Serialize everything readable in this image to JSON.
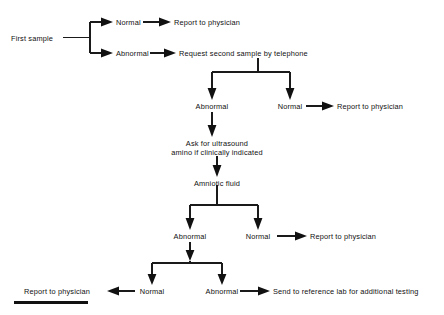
{
  "diagram": {
    "background": "#ffffff",
    "ink": "#111111",
    "nodes": {
      "first_sample": "First sample",
      "branch1_normal": "Normal",
      "branch1_normal_action": "Report to physician",
      "branch1_abnormal": "Abnormal",
      "branch1_abnormal_action": "Request second sample by telephone",
      "branch2_abnormal": "Abnormal",
      "branch2_normal": "Normal",
      "branch2_normal_action": "Report to physician",
      "ultrasound_line1": "Ask for ultrasound",
      "ultrasound_line2": "amino if clinically indicated",
      "amniotic_fluid": "Amniotic fluid",
      "branch3_abnormal": "Abnormal",
      "branch3_normal": "Normal",
      "branch3_normal_action": "Report to physician",
      "branch4_normal": "Normal",
      "branch4_normal_action": "Report to physician",
      "branch4_abnormal": "Abnormal",
      "branch4_abnormal_action": "Send to reference lab for additional testing"
    },
    "footer_rule": ""
  }
}
